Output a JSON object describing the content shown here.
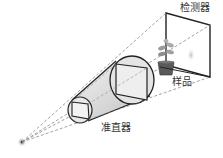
{
  "diagram": {
    "type": "x-ray imaging setup schematic",
    "labels": {
      "detector": "检测器",
      "sample": "样品",
      "collimator": "准直器"
    },
    "components": [
      {
        "id": "source",
        "name": "point source"
      },
      {
        "id": "collimator",
        "name": "准直器",
        "shape": "truncated cone with square apertures"
      },
      {
        "id": "sample",
        "name": "样品",
        "shape": "potted plant"
      },
      {
        "id": "detector",
        "name": "检测器",
        "shape": "flat panel"
      }
    ],
    "colors": {
      "line": "#222222",
      "dashed_ray": "#8a8a8a",
      "pot": "#5a5a5a",
      "leaf": "#9a9a9a",
      "shadow": "#c8c8c8"
    }
  }
}
